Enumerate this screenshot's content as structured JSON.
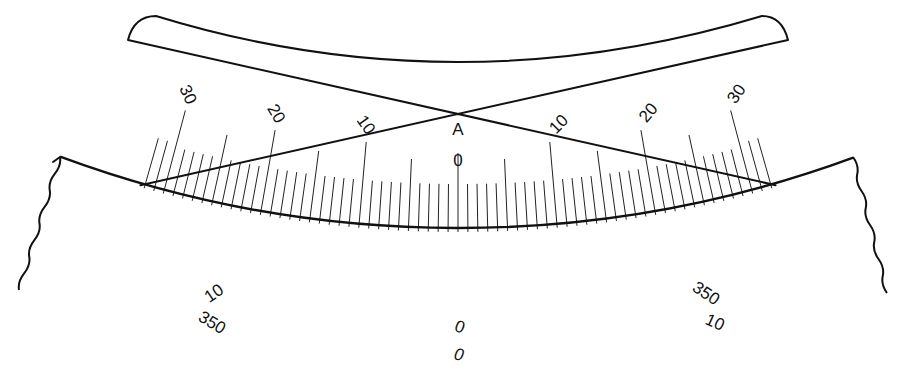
{
  "colors": {
    "ink": "#111111",
    "background": "#ffffff"
  },
  "geometry": {
    "center_x": 458,
    "center_y": -917,
    "radius": 1145,
    "left_end": [
      60,
      157
    ],
    "right_end": [
      853,
      157
    ]
  },
  "vernier_plate": {
    "label_index": "A",
    "index_value": "0",
    "division_px": 9.9,
    "divisions_each_side": 30,
    "left_labels": [
      {
        "value": 10,
        "text": "10"
      },
      {
        "value": 20,
        "text": "20"
      },
      {
        "value": 30,
        "text": "30"
      }
    ],
    "right_labels": [
      {
        "value": 10,
        "text": "10"
      },
      {
        "value": 20,
        "text": "20"
      },
      {
        "value": 30,
        "text": "30"
      }
    ],
    "extra_divisions_beyond_30": 2
  },
  "main_scale": {
    "division_px": 10.85,
    "divisions_each_side": 37,
    "labels": [
      {
        "position": 0,
        "inner_text": "0",
        "outer_text": "0"
      },
      {
        "position": -20,
        "inner_text": "10",
        "outer_text": "350"
      },
      {
        "position": 20,
        "inner_text": "350",
        "outer_text": "10"
      }
    ]
  }
}
